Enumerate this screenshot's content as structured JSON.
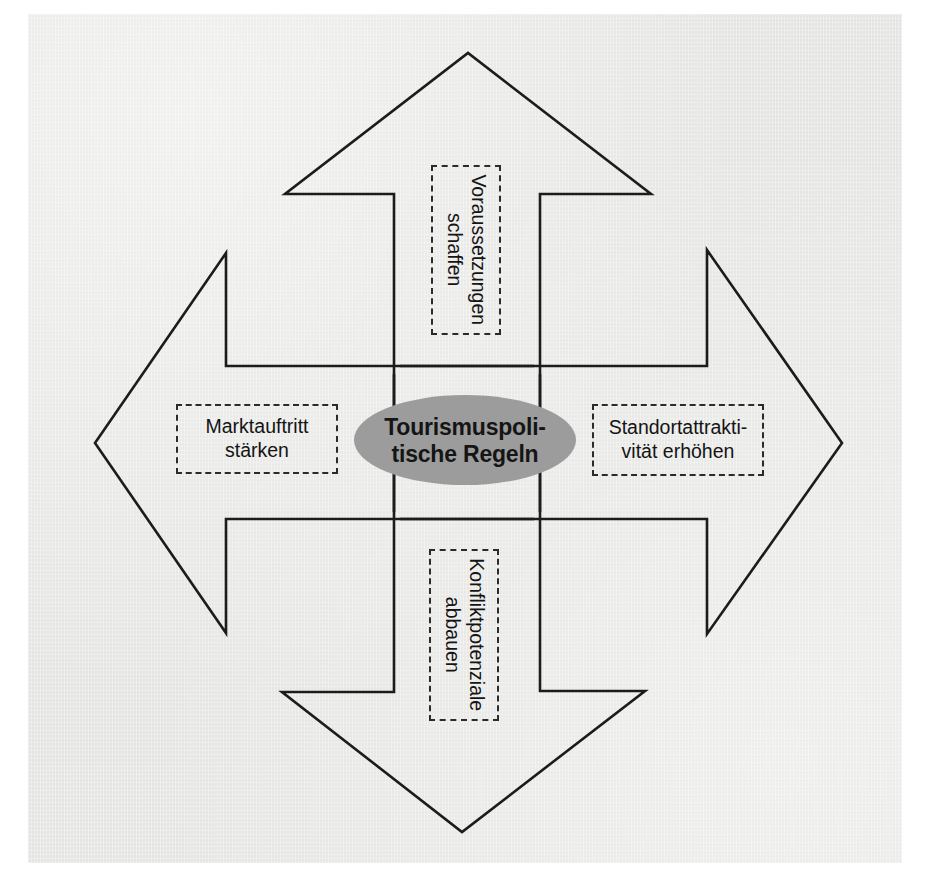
{
  "figure": {
    "kind": "four-way-arrow-diagram",
    "background_color": "#e8e8e6",
    "line_color": "#1c1c1c",
    "center_fill_color": "#9c9c9c",
    "box_border_style": "dashed"
  },
  "center": {
    "name": "center-ellipse",
    "line1": "Tourismuspoli-",
    "line2": "tische Regeln"
  },
  "arrows": {
    "top": {
      "direction": "up",
      "label_orientation": "vertical",
      "line1": "Voraussetzungen",
      "line2": "schaffen"
    },
    "right": {
      "direction": "right",
      "label_orientation": "horizontal",
      "line1": "Standortattrakti-",
      "line2": "vität erhöhen"
    },
    "bottom": {
      "direction": "down",
      "label_orientation": "vertical",
      "line1": "Konfliktpotenziale",
      "line2": "abbauen"
    },
    "left": {
      "direction": "left",
      "label_orientation": "horizontal",
      "line1": "Marktauftritt",
      "line2": "stärken"
    }
  }
}
